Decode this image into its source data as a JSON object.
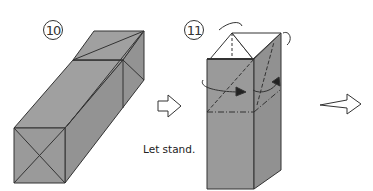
{
  "steps": [
    {
      "number": "10",
      "description": "Long rectangular box, lying flat"
    },
    {
      "number": "11",
      "description": "Box standing upright, top flaps folded in"
    }
  ],
  "captions": {
    "let_stand": "Let stand."
  },
  "colors": {
    "paper_gray": "#9a9a9a",
    "paper_gray_side": "#8f8f8f",
    "paper_white": "#ffffff",
    "line": "#333333"
  }
}
